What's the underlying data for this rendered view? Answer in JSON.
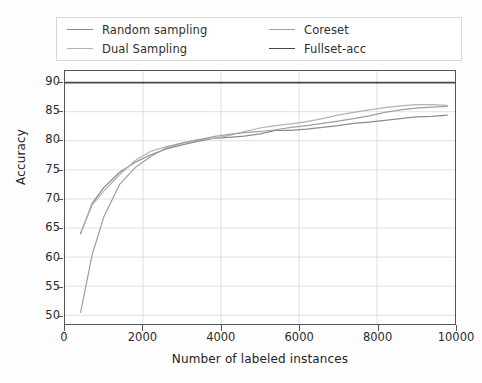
{
  "chart_data": {
    "type": "line",
    "title": "",
    "xlabel": "Number of labeled instances",
    "ylabel": "Accuracy",
    "xlim": [
      0,
      10000
    ],
    "ylim": [
      48.5,
      92
    ],
    "xticks": [
      0,
      2000,
      4000,
      6000,
      8000,
      10000
    ],
    "xtick_labels": [
      "0",
      "2000",
      "4000",
      "6000",
      "8000",
      "10000"
    ],
    "yticks": [
      50,
      55,
      60,
      65,
      70,
      75,
      80,
      85,
      90
    ],
    "ytick_labels": [
      "50",
      "55",
      "60",
      "65",
      "70",
      "75",
      "80",
      "85",
      "90"
    ],
    "grid": true,
    "legend_position": "upper center (2 columns, above axes)",
    "series": [
      {
        "name": "Random sampling",
        "color": "#8c8c8c",
        "x": [
          400,
          700,
          1000,
          1400,
          1800,
          2200,
          2600,
          3000,
          3400,
          3800,
          4200,
          4600,
          5000,
          5400,
          5800,
          6200,
          6600,
          7000,
          7400,
          7800,
          8200,
          8600,
          9000,
          9400,
          9800
        ],
        "y": [
          64.0,
          69.3,
          72.0,
          74.6,
          76.3,
          77.6,
          78.6,
          79.3,
          79.9,
          80.4,
          80.6,
          80.8,
          81.2,
          81.8,
          81.8,
          82.0,
          82.3,
          82.6,
          83.0,
          83.2,
          83.5,
          83.8,
          84.1,
          84.2,
          84.4
        ]
      },
      {
        "name": "Dual Sampling",
        "color": "#b3b3b3",
        "x": [
          400,
          700,
          1000,
          1400,
          1800,
          2200,
          2600,
          3000,
          3400,
          3800,
          4200,
          4600,
          5000,
          5400,
          5800,
          6200,
          6600,
          7000,
          7400,
          7800,
          8200,
          8600,
          9000,
          9400,
          9800
        ],
        "y": [
          64.2,
          69.0,
          71.4,
          74.2,
          76.6,
          78.2,
          79.0,
          79.6,
          80.2,
          80.4,
          80.9,
          81.6,
          82.2,
          82.6,
          82.9,
          83.3,
          83.8,
          84.4,
          84.9,
          85.3,
          85.7,
          86.0,
          86.2,
          86.2,
          86.1
        ]
      },
      {
        "name": "Coreset",
        "color": "#a0a0a0",
        "x": [
          400,
          700,
          1000,
          1400,
          1800,
          2200,
          2600,
          3000,
          3400,
          3800,
          4200,
          4600,
          5000,
          5400,
          5800,
          6200,
          6600,
          7000,
          7400,
          7800,
          8200,
          8600,
          9000,
          9400,
          9800
        ],
        "y": [
          50.5,
          60.5,
          67.0,
          72.5,
          75.4,
          77.3,
          78.8,
          79.6,
          80.1,
          80.7,
          81.1,
          81.4,
          81.6,
          81.9,
          82.3,
          82.6,
          83.0,
          83.4,
          83.8,
          84.3,
          84.9,
          85.3,
          85.6,
          85.8,
          85.9
        ]
      },
      {
        "name": "Fullset-acc",
        "color": "#4a4a4a",
        "constant_value": 90.0,
        "x": [
          0,
          10000
        ],
        "y": [
          90.0,
          90.0
        ]
      }
    ]
  },
  "legend": {
    "entries": [
      {
        "label": "Random sampling",
        "color": "#8c8c8c"
      },
      {
        "label": "Dual Sampling",
        "color": "#b3b3b3"
      },
      {
        "label": "Coreset",
        "color": "#a0a0a0"
      },
      {
        "label": "Fullset-acc",
        "color": "#4a4a4a"
      }
    ]
  },
  "axes": {
    "x_title": "Number of labeled instances",
    "y_title": "Accuracy"
  }
}
